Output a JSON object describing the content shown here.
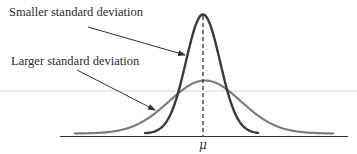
{
  "chart_data": {
    "type": "line",
    "title": "",
    "xlabel": "",
    "ylabel": "",
    "x_ticks": [
      "μ"
    ],
    "grid": false,
    "legend": null,
    "annotations": [
      {
        "text": "Smaller standard deviation",
        "points_to": "narrow tall curve"
      },
      {
        "text": "Larger standard deviation",
        "points_to": "wide short curve"
      }
    ],
    "series": [
      {
        "name": "Smaller standard deviation",
        "distribution": "normal",
        "mean": "μ",
        "relative_sd": 1.0,
        "relative_peak": 1.0,
        "color": "#3a3a3a"
      },
      {
        "name": "Larger standard deviation",
        "distribution": "normal",
        "mean": "μ",
        "relative_sd": 2.2,
        "relative_peak": 0.45,
        "color": "#7d7d7d"
      }
    ],
    "mean_marker": {
      "style": "dashed vertical line",
      "label": "μ"
    }
  },
  "labels": {
    "smaller": "Smaller standard deviation",
    "larger": "Larger standard deviation",
    "mu": "μ"
  },
  "colors": {
    "narrow_curve": "#3a3a3a",
    "wide_curve": "#7d7d7d",
    "axis": "#333333",
    "guide_line": "#d6d6d6"
  }
}
